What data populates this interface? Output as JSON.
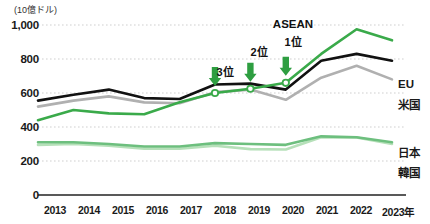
{
  "axis": {
    "unit_label": "(10億ドル)",
    "y_ticks": [
      "1,000",
      "800",
      "600",
      "400",
      "200",
      "0"
    ],
    "x_ticks": [
      "2013",
      "2014",
      "2015",
      "2016",
      "2017",
      "2018",
      "2019",
      "2020",
      "2021",
      "2022",
      "2023年"
    ]
  },
  "legend": {
    "eu": "EU",
    "us": "米国",
    "japan": "日本",
    "korea": "韓国"
  },
  "annotations": {
    "rank3": "3位",
    "rank2": "2位",
    "rank1": "1位",
    "asean_title": "ASEAN"
  },
  "colors": {
    "asean": "#3aaa4a",
    "eu": "#111111",
    "us": "#b0b0b0",
    "japan": "#6dbf7e",
    "korea": "#b6e0b9",
    "grid": "#cfcfcf",
    "axis": "#222222",
    "arrow": "#2e9e41"
  },
  "chart_data": {
    "type": "line",
    "title": "",
    "subtitle": "",
    "xlabel": "",
    "ylabel": "(10億ドル)",
    "ylim": [
      0,
      1000
    ],
    "yticks": [
      0,
      200,
      400,
      600,
      800,
      1000
    ],
    "grid": true,
    "legend_position": "right",
    "x": [
      2013,
      2014,
      2015,
      2016,
      2017,
      2018,
      2019,
      2020,
      2021,
      2022,
      2023
    ],
    "series": [
      {
        "name": "ASEAN",
        "color": "#3aaa4a",
        "values": [
          440,
          500,
          480,
          475,
          545,
          600,
          625,
          660,
          830,
          975,
          910
        ],
        "markers": [
          {
            "x": 2018,
            "y": 600,
            "rank": "3位"
          },
          {
            "x": 2019,
            "y": 625,
            "rank": "2位"
          },
          {
            "x": 2020,
            "y": 660,
            "rank": "1位"
          }
        ]
      },
      {
        "name": "EU",
        "color": "#111111",
        "values": [
          555,
          590,
          620,
          570,
          565,
          650,
          655,
          620,
          790,
          830,
          790
        ]
      },
      {
        "name": "米国",
        "color": "#b0b0b0",
        "values": [
          520,
          555,
          580,
          545,
          540,
          605,
          620,
          560,
          690,
          760,
          680
        ]
      },
      {
        "name": "日本",
        "color": "#6dbf7e",
        "values": [
          310,
          310,
          300,
          285,
          285,
          305,
          300,
          295,
          345,
          340,
          310
        ]
      },
      {
        "name": "韓国",
        "color": "#b6e0b9",
        "values": [
          295,
          300,
          290,
          272,
          272,
          290,
          270,
          268,
          340,
          338,
          300
        ]
      }
    ],
    "annotations": [
      {
        "text": "3位",
        "x": 2018,
        "points_to_series": "ASEAN"
      },
      {
        "text": "2位",
        "x": 2019,
        "points_to_series": "ASEAN"
      },
      {
        "text": "ASEAN 1位",
        "x": 2020,
        "points_to_series": "ASEAN"
      }
    ]
  }
}
